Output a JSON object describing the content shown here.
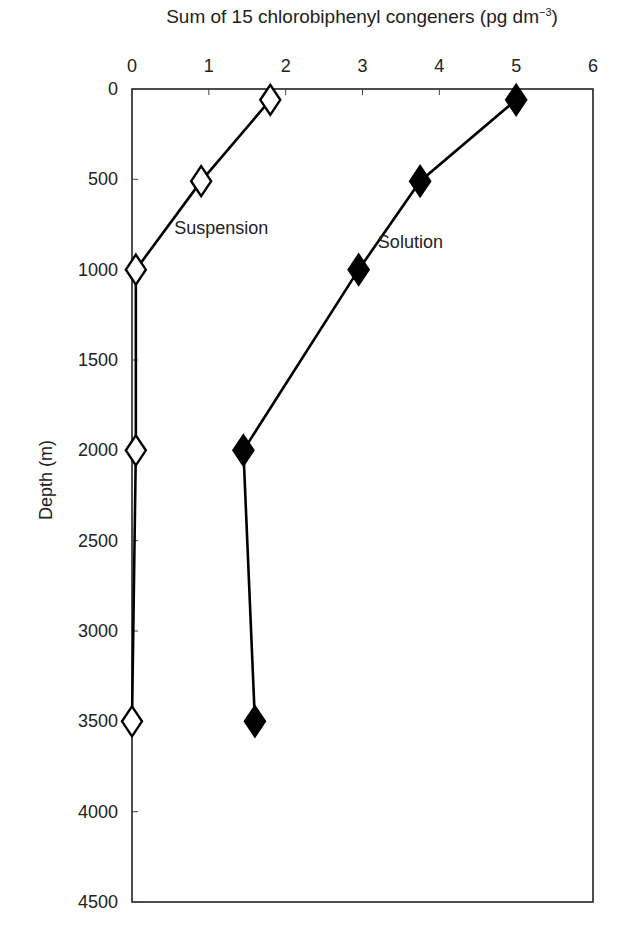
{
  "chart_data": {
    "type": "line",
    "title_main": "Sum of 15 chlorobiphenyl congeners (pg dm",
    "title_sup": "−3",
    "title_close": ")",
    "xlabel": "Sum of 15 chlorobiphenyl congeners (pg dm-3)",
    "ylabel": "Depth (m)",
    "x_axis_position": "top",
    "y_axis_inverted": true,
    "xlim": [
      0,
      6
    ],
    "ylim": [
      0,
      4500
    ],
    "x_ticks": [
      0,
      1,
      2,
      3,
      4,
      5,
      6
    ],
    "y_ticks": [
      0,
      500,
      1000,
      1500,
      2000,
      2500,
      3000,
      3500,
      4000,
      4500
    ],
    "grid": false,
    "legend": "inline annotations",
    "series": [
      {
        "name": "Suspension",
        "marker": "open-diamond",
        "color": "#000000",
        "label_pos": {
          "x": 0.55,
          "y": 800
        },
        "points": [
          {
            "x": 1.8,
            "depth": 60
          },
          {
            "x": 0.9,
            "depth": 510
          },
          {
            "x": 0.05,
            "depth": 1000
          },
          {
            "x": 0.05,
            "depth": 2000
          },
          {
            "x": 0.0,
            "depth": 3500
          }
        ]
      },
      {
        "name": "Solution",
        "marker": "filled-diamond",
        "color": "#000000",
        "label_pos": {
          "x": 3.2,
          "y": 880
        },
        "points": [
          {
            "x": 5.0,
            "depth": 60
          },
          {
            "x": 3.75,
            "depth": 510
          },
          {
            "x": 2.95,
            "depth": 1000
          },
          {
            "x": 1.45,
            "depth": 2000
          },
          {
            "x": 1.6,
            "depth": 3500
          }
        ]
      }
    ]
  }
}
